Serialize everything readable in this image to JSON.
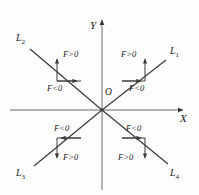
{
  "figure": {
    "type": "coordinate-diagram",
    "background_color": "#fdfdfd",
    "stroke_color": "#3a3a3a",
    "text_color": "#1a1a1a"
  },
  "axes": {
    "x_label": "X",
    "y_label": "Y",
    "origin_label": "O",
    "origin_px": [
      102,
      110
    ],
    "x_range_px": [
      10,
      187
    ],
    "y_range_px": [
      16,
      190
    ]
  },
  "lines": [
    {
      "name": "L",
      "sub": "1",
      "label": "L₁",
      "quadrant": 1,
      "slope": "positive",
      "endpoint_px": [
        166,
        60
      ],
      "annotations": [
        {
          "text": "F>0",
          "arrow": "up",
          "x": 121,
          "y": 51
        },
        {
          "text": "F<0",
          "arrow": "right",
          "x": 130,
          "y": 84
        }
      ]
    },
    {
      "name": "L",
      "sub": "2",
      "label": "L₂",
      "quadrant": 2,
      "slope": "negative",
      "endpoint_px": [
        30,
        48
      ],
      "annotations": [
        {
          "text": "F>0",
          "arrow": "up",
          "x": 57,
          "y": 51
        },
        {
          "text": "F<0",
          "arrow": "right",
          "x": 48,
          "y": 84
        }
      ]
    },
    {
      "name": "L",
      "sub": "3",
      "label": "L₃",
      "quadrant": 3,
      "slope": "positive",
      "endpoint_px": [
        34,
        165
      ],
      "annotations": [
        {
          "text": "F<0",
          "arrow": "left",
          "x": 55,
          "y": 126
        },
        {
          "text": "F>0",
          "arrow": "down",
          "x": 57,
          "y": 152
        }
      ]
    },
    {
      "name": "L",
      "sub": "4",
      "label": "L₄",
      "quadrant": 4,
      "slope": "negative",
      "endpoint_px": [
        167,
        163
      ],
      "annotations": [
        {
          "text": "F<0",
          "arrow": "right",
          "x": 127,
          "y": 126
        },
        {
          "text": "F>0",
          "arrow": "down",
          "x": 120,
          "y": 152
        }
      ]
    }
  ],
  "labels": {
    "y_axis": "Y",
    "x_axis": "X",
    "origin": "O",
    "l1": "L",
    "l1_sub": "1",
    "l2": "L",
    "l2_sub": "2",
    "l3": "L",
    "l3_sub": "3",
    "l4": "L",
    "l4_sub": "4",
    "q1_positive": "F>0",
    "q1_negative": "F<0",
    "q2_positive": "F>0",
    "q2_negative": "F<0",
    "q3_negative": "F<0",
    "q3_positive": "F>0",
    "q4_negative": "F<0",
    "q4_positive": "F>0"
  }
}
